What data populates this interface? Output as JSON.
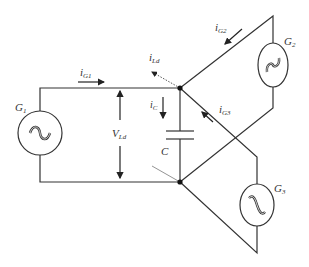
{
  "diagram": {
    "title": "",
    "generators": [
      {
        "id": "G1",
        "label": "G",
        "sub": "1"
      },
      {
        "id": "G2",
        "label": "G",
        "sub": "2"
      },
      {
        "id": "G3",
        "label": "G",
        "sub": "3"
      }
    ],
    "currents": {
      "iG1": {
        "label": "i",
        "sub": "G1"
      },
      "iG2": {
        "label": "i",
        "sub": "G2"
      },
      "iG3": {
        "label": "i",
        "sub": "G3"
      },
      "iLd": {
        "label": "i",
        "sub": "Ld"
      },
      "iC": {
        "label": "i",
        "sub": "C"
      }
    },
    "voltage": {
      "label": "V",
      "sub": "Ld"
    },
    "capacitor": {
      "label": "C"
    },
    "colors": {
      "line": "#333333",
      "dotted": "#555555"
    }
  }
}
